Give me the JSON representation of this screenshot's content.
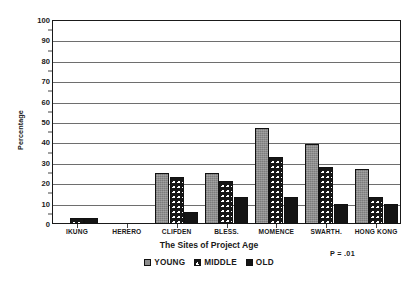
{
  "chart_data": {
    "type": "bar",
    "title": "",
    "xlabel": "The Sites of Project Age",
    "ylabel": "Percentage",
    "ylim": [
      0,
      100
    ],
    "ytick_step": 10,
    "yticks": [
      "0",
      "10",
      "20",
      "30",
      "40",
      "50",
      "60",
      "70",
      "80",
      "90",
      "100"
    ],
    "grid": true,
    "legend_position": "bottom-center",
    "categories": [
      "IKUNG",
      "HERERO",
      "CLIFDEN",
      "BLESS.",
      "MOMENCE",
      "SWARTH.",
      "HONG KONG"
    ],
    "series": [
      {
        "name": "YOUNG",
        "color": "#8d8d8d",
        "pattern": "gray-fill",
        "values": [
          0,
          0,
          25,
          25,
          47,
          39,
          27
        ]
      },
      {
        "name": "MIDDLE",
        "color": "#ffffff",
        "pattern": "crosshatch",
        "values": [
          3,
          0,
          23,
          21,
          33,
          28,
          13
        ]
      },
      {
        "name": "OLD",
        "color": "#141414",
        "pattern": "solid-black",
        "values": [
          3,
          0,
          6,
          13,
          13,
          10,
          10
        ]
      }
    ],
    "annotations": [
      {
        "name": "p-value",
        "text": "P = .01"
      }
    ]
  },
  "legend": {
    "items": [
      {
        "label": "YOUNG"
      },
      {
        "label": "MIDDLE"
      },
      {
        "label": "OLD"
      }
    ]
  }
}
